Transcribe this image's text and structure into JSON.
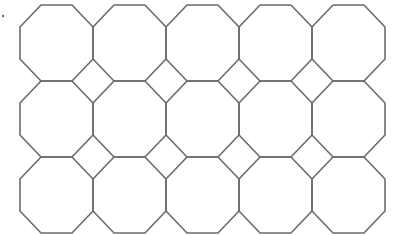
{
  "diagram": {
    "type": "truncated-square-tiling",
    "shape_primary": "octagon",
    "shape_secondary": "square (diamond)",
    "rows": 3,
    "columns": 5,
    "octagon_count": 15,
    "square_count": 8,
    "grid": {
      "origin_x": 20,
      "origin_y": 5,
      "cell_width": 73,
      "cell_height": 76,
      "cut_x": 21,
      "cut_y": 22
    },
    "colors": {
      "stroke": "#6b6b6b",
      "background": "#ffffff"
    },
    "marker": {
      "x": 3,
      "y": 16,
      "r": 1.2
    }
  }
}
